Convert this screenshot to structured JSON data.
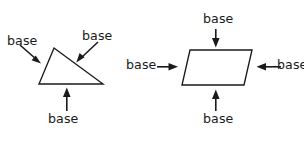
{
  "figure": {
    "background_color": "#ffffff",
    "ink_color": "#1a1a1a",
    "title_visible": false,
    "shapes": [
      {
        "id": "triangle",
        "name": "triangle",
        "vertices": [
          [
            54,
            48
          ],
          [
            39,
            84
          ],
          [
            103,
            84
          ]
        ],
        "labels": [
          {
            "id": "triangle-label-left",
            "text": "base",
            "x": 7,
            "y": 34,
            "target_side": "left-slanted-side",
            "arrow": {
              "x1": 21,
              "y1": 46,
              "x2": 40,
              "y2": 63,
              "direction": "down-right"
            }
          },
          {
            "id": "triangle-label-top-right",
            "text": "base",
            "x": 82,
            "y": 29,
            "target_side": "right-slanted-side",
            "arrow": {
              "x1": 97,
              "y1": 43,
              "x2": 77,
              "y2": 62,
              "direction": "down-left"
            }
          },
          {
            "id": "triangle-label-bottom",
            "text": "base",
            "x": 48,
            "y": 112,
            "target_side": "bottom-side",
            "arrow": {
              "x1": 67,
              "y1": 110,
              "x2": 67,
              "y2": 88,
              "direction": "up"
            }
          }
        ]
      },
      {
        "id": "parallelogram",
        "name": "parallelogram",
        "vertices": [
          [
            190,
            50
          ],
          [
            252,
            50
          ],
          [
            244,
            85
          ],
          [
            182,
            85
          ]
        ],
        "labels": [
          {
            "id": "parallelogram-label-top",
            "text": "base",
            "x": 203,
            "y": 12,
            "target_side": "top-side",
            "arrow": {
              "x1": 216,
              "y1": 29,
              "x2": 216,
              "y2": 47,
              "direction": "down"
            }
          },
          {
            "id": "parallelogram-label-left",
            "text": "base",
            "x": 126,
            "y": 58,
            "target_side": "left-slanted-side",
            "arrow": {
              "x1": 157,
              "y1": 67,
              "x2": 178,
              "y2": 67,
              "direction": "right"
            }
          },
          {
            "id": "parallelogram-label-right",
            "text": "base",
            "x": 277,
            "y": 58,
            "target_side": "right-slanted-side",
            "arrow": {
              "x1": 281,
              "y1": 67,
              "x2": 256,
              "y2": 67,
              "direction": "left"
            }
          },
          {
            "id": "parallelogram-label-bottom",
            "text": "base",
            "x": 203,
            "y": 112,
            "target_side": "bottom-side",
            "arrow": {
              "x1": 216,
              "y1": 111,
              "x2": 216,
              "y2": 90,
              "direction": "up"
            }
          }
        ]
      }
    ]
  }
}
